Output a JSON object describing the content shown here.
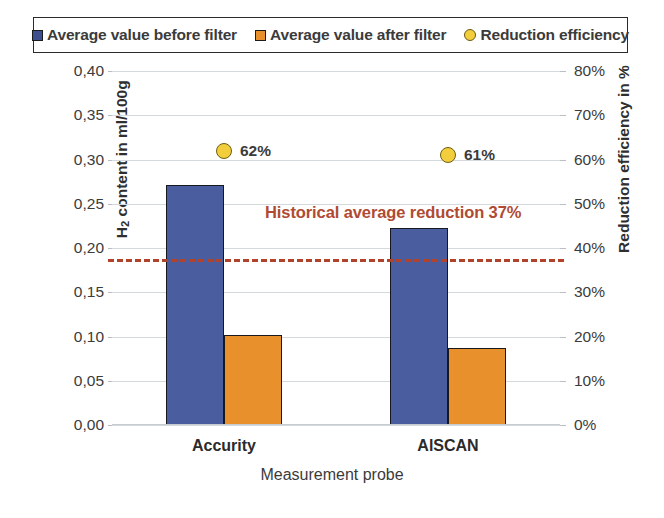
{
  "legend": {
    "items": [
      {
        "label": "Average value before filter",
        "marker": "square",
        "color": "#4a5d9e",
        "name": "legend-item-before-filter"
      },
      {
        "label": "Average value after filter",
        "marker": "square",
        "color": "#e8912c",
        "name": "legend-item-after-filter"
      },
      {
        "label": "Reduction efficiency",
        "marker": "circle",
        "color": "#f3ce3c",
        "name": "legend-item-reduction-efficiency"
      }
    ]
  },
  "axes": {
    "left_title_prefix": "H",
    "left_title_sub": "2",
    "left_title_suffix": " content in ml/100g",
    "right_title": "Reduction efficiency in %",
    "x_title": "Measurement probe",
    "left_ticks": [
      "0,00",
      "0,05",
      "0,10",
      "0,15",
      "0,20",
      "0,25",
      "0,30",
      "0,35",
      "0,40"
    ],
    "right_ticks": [
      "0%",
      "10%",
      "20%",
      "30%",
      "40%",
      "50%",
      "60%",
      "70%",
      "80%"
    ]
  },
  "annotation": {
    "text": "Historical average reduction 37%",
    "color": "#b04a32",
    "value_percent": 37,
    "value_left_axis": 0.1875
  },
  "chart_data": {
    "type": "bar",
    "title": "",
    "xlabel": "Measurement probe",
    "ylabel": "H2 content in ml/100g",
    "y2label": "Reduction efficiency in %",
    "ylim": [
      0,
      0.4
    ],
    "y2lim": [
      0,
      0.8
    ],
    "grid": true,
    "legend_position": "top",
    "categories": [
      "Accurity",
      "AlSCAN"
    ],
    "series": [
      {
        "name": "Average value before filter",
        "type": "bar",
        "axis": "left",
        "color": "#4a5d9e",
        "values": [
          0.271,
          0.223
        ]
      },
      {
        "name": "Average value after filter",
        "type": "bar",
        "axis": "left",
        "color": "#e8912c",
        "values": [
          0.102,
          0.087
        ]
      },
      {
        "name": "Reduction efficiency",
        "type": "scatter",
        "axis": "right",
        "color": "#f3ce3c",
        "values": [
          0.62,
          0.61
        ],
        "labels": [
          "62%",
          "61%"
        ]
      }
    ],
    "reference_line": {
      "label": "Historical average reduction 37%",
      "axis": "right",
      "value": 0.375,
      "style": "dashed",
      "color": "#b2432b"
    }
  }
}
